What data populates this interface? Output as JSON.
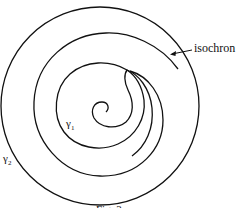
{
  "figure": {
    "labels": {
      "isochron": "isochron",
      "gamma1": "γ",
      "gamma1_sub": "1",
      "gamma2": "γ",
      "gamma2_sub": "2"
    },
    "caption": "Fig. 3",
    "colors": {
      "stroke": "#111111",
      "background": "#ffffff"
    }
  }
}
